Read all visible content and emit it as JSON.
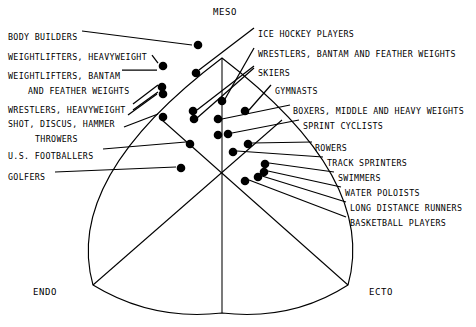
{
  "figure": {
    "type": "somatotype-scatter"
  },
  "axes": {
    "meso": "MESO",
    "endo": "ENDO",
    "ecto": "ECTO"
  },
  "labels_left": [
    {
      "id": "body-builders",
      "text": "BODY BUILDERS",
      "x": 8,
      "y": 33,
      "indent": false
    },
    {
      "id": "weightlifters-heavyweight",
      "text": "WEIGHTLIFTERS, HEAVYWEIGHT",
      "x": 8,
      "y": 53,
      "indent": false
    },
    {
      "id": "weightlifters-bantam",
      "text": "WEIGHTLIFTERS, BANTAM",
      "x": 8,
      "y": 72,
      "indent": false
    },
    {
      "id": "and-feather-weights",
      "text": "AND FEATHER WEIGHTS",
      "x": 28,
      "y": 87,
      "indent": true
    },
    {
      "id": "wrestlers-heavyweight",
      "text": "WRESTLERS, HEAVYWEIGHT",
      "x": 8,
      "y": 106,
      "indent": false
    },
    {
      "id": "shot-discus-hammer",
      "text": "SHOT, DISCUS, HAMMER",
      "x": 8,
      "y": 120,
      "indent": false
    },
    {
      "id": "throwers",
      "text": "THROWERS",
      "x": 35,
      "y": 135,
      "indent": true
    },
    {
      "id": "us-footballers",
      "text": "U.S. FOOTBALLERS",
      "x": 8,
      "y": 152,
      "indent": false
    },
    {
      "id": "golfers",
      "text": "GOLFERS",
      "x": 8,
      "y": 173,
      "indent": false
    }
  ],
  "labels_right": [
    {
      "id": "ice-hockey-players",
      "text": "ICE HOCKEY PLAYERS",
      "x": 258,
      "y": 30
    },
    {
      "id": "wrestlers-bantam-feather",
      "text": "WRESTLERS, BANTAM AND FEATHER WEIGHTS",
      "x": 258,
      "y": 50
    },
    {
      "id": "skiers",
      "text": "SKIERS",
      "x": 258,
      "y": 69
    },
    {
      "id": "gymnasts",
      "text": "GYMNASTS",
      "x": 275,
      "y": 87
    },
    {
      "id": "boxers-middle-heavy",
      "text": "BOXERS, MIDDLE AND HEAVY WEIGHTS",
      "x": 293,
      "y": 107
    },
    {
      "id": "sprint-cyclists",
      "text": "SPRINT CYCLISTS",
      "x": 303,
      "y": 122
    },
    {
      "id": "rowers",
      "text": "ROWERS",
      "x": 315,
      "y": 144
    },
    {
      "id": "track-sprinters",
      "text": "TRACK SPRINTERS",
      "x": 327,
      "y": 159
    },
    {
      "id": "swimmers",
      "text": "SWIMMERS",
      "x": 338,
      "y": 174
    },
    {
      "id": "water-poloists",
      "text": "WATER POLOISTS",
      "x": 345,
      "y": 189
    },
    {
      "id": "long-distance-runners",
      "text": "LONG DISTANCE RUNNERS",
      "x": 350,
      "y": 204
    },
    {
      "id": "basketball-players",
      "text": "BASKETBALL PLAYERS",
      "x": 350,
      "y": 219
    }
  ],
  "axis_positions": {
    "meso": {
      "x": 213,
      "y": 8
    },
    "endo": {
      "x": 33,
      "y": 288
    },
    "ecto": {
      "x": 369,
      "y": 288
    }
  },
  "chart_data": {
    "type": "scatter",
    "xlabel": "",
    "ylabel": "",
    "points": [
      {
        "id": "body-builders",
        "x": 198,
        "y": 45
      },
      {
        "id": "weightlifters-heavyweight",
        "x": 163,
        "y": 66
      },
      {
        "id": "ice-hockey-players",
        "x": 196,
        "y": 73
      },
      {
        "id": "weightlifters-bantam-a",
        "x": 162,
        "y": 87
      },
      {
        "id": "weightlifters-bantam-b",
        "x": 163,
        "y": 94
      },
      {
        "id": "wrestlers-bantam-feather",
        "x": 222,
        "y": 101
      },
      {
        "id": "skiers-a",
        "x": 193,
        "y": 111
      },
      {
        "id": "skiers-b",
        "x": 194,
        "y": 119
      },
      {
        "id": "gymnasts",
        "x": 245,
        "y": 111
      },
      {
        "id": "shot-discus-hammer",
        "x": 163,
        "y": 117
      },
      {
        "id": "boxers-middle-heavy",
        "x": 218,
        "y": 119
      },
      {
        "id": "sprint-cyclists-a",
        "x": 218,
        "y": 135
      },
      {
        "id": "sprint-cyclists-b",
        "x": 228,
        "y": 134
      },
      {
        "id": "us-footballers",
        "x": 190,
        "y": 144
      },
      {
        "id": "rowers",
        "x": 248,
        "y": 144
      },
      {
        "id": "track-sprinters",
        "x": 233,
        "y": 152
      },
      {
        "id": "golfers",
        "x": 181,
        "y": 168
      },
      {
        "id": "swimmers",
        "x": 265,
        "y": 164
      },
      {
        "id": "water-poloists",
        "x": 264,
        "y": 172
      },
      {
        "id": "long-distance-runners",
        "x": 258,
        "y": 177
      },
      {
        "id": "basketball-players",
        "x": 245,
        "y": 181
      }
    ],
    "grid": false,
    "legend": false
  },
  "leaders": [
    {
      "id": "leader-body-builders",
      "x1": 82,
      "y1": 31,
      "x2": 192,
      "y2": 45
    },
    {
      "id": "leader-weightlifters-heavyweight",
      "x1": 152,
      "y1": 55,
      "x2": 158,
      "y2": 63
    },
    {
      "id": "leader-weightlifters-bantam",
      "x1": 122,
      "y1": 70,
      "x2": 157,
      "y2": 70
    },
    {
      "id": "leader-and-feather-a",
      "x1": 133,
      "y1": 104,
      "x2": 158,
      "y2": 85
    },
    {
      "id": "leader-and-feather-b",
      "x1": 133,
      "y1": 110,
      "x2": 158,
      "y2": 92
    },
    {
      "id": "leader-wrestlers-heavyweight",
      "x1": 128,
      "y1": 115,
      "x2": 157,
      "y2": 94
    },
    {
      "id": "leader-shot-discus",
      "x1": 124,
      "y1": 127,
      "x2": 158,
      "y2": 114
    },
    {
      "id": "leader-us-footballers",
      "x1": 103,
      "y1": 149,
      "x2": 186,
      "y2": 142
    },
    {
      "id": "leader-golfers",
      "x1": 55,
      "y1": 172,
      "x2": 176,
      "y2": 167
    },
    {
      "id": "leader-ice-hockey",
      "x1": 254,
      "y1": 28,
      "x2": 199,
      "y2": 70
    },
    {
      "id": "leader-wrestlers-bantam",
      "x1": 254,
      "y1": 48,
      "x2": 225,
      "y2": 99
    },
    {
      "id": "leader-skiers",
      "x1": 254,
      "y1": 66,
      "x2": 197,
      "y2": 110
    },
    {
      "id": "leader-skiers-2",
      "x1": 254,
      "y1": 68,
      "x2": 197,
      "y2": 118
    },
    {
      "id": "leader-gymnasts",
      "x1": 271,
      "y1": 85,
      "x2": 249,
      "y2": 110
    },
    {
      "id": "leader-boxers",
      "x1": 290,
      "y1": 105,
      "x2": 222,
      "y2": 119
    },
    {
      "id": "leader-sprint-cyclists",
      "x1": 299,
      "y1": 120,
      "x2": 232,
      "y2": 133
    },
    {
      "id": "leader-rowers",
      "x1": 312,
      "y1": 142,
      "x2": 252,
      "y2": 143
    },
    {
      "id": "leader-track-sprinters",
      "x1": 323,
      "y1": 157,
      "x2": 237,
      "y2": 151
    },
    {
      "id": "leader-swimmers",
      "x1": 334,
      "y1": 172,
      "x2": 269,
      "y2": 163
    },
    {
      "id": "leader-water-poloists",
      "x1": 341,
      "y1": 187,
      "x2": 268,
      "y2": 171
    },
    {
      "id": "leader-long-distance",
      "x1": 346,
      "y1": 202,
      "x2": 262,
      "y2": 176
    },
    {
      "id": "leader-basketball",
      "x1": 346,
      "y1": 217,
      "x2": 249,
      "y2": 180
    }
  ],
  "shield": {
    "apex": {
      "x": 222,
      "y": 58
    },
    "left_corner": {
      "x": 93,
      "y": 285
    },
    "right_corner": {
      "x": 348,
      "y": 285
    },
    "bottom": {
      "x": 222,
      "y": 313
    },
    "center": {
      "x": 222,
      "y": 214
    }
  },
  "colors": {
    "ink": "#000000",
    "background": "#ffffff"
  }
}
